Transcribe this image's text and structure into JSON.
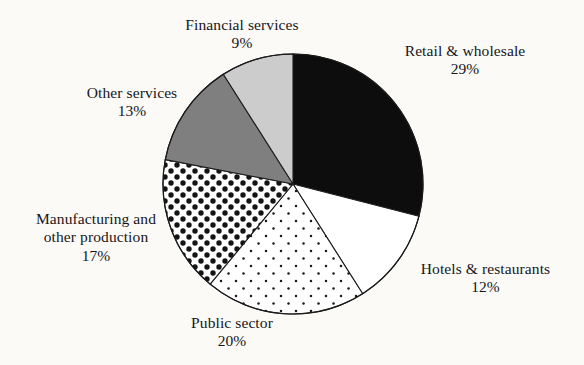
{
  "chart_data": {
    "type": "pie",
    "title": "",
    "subtitle": "",
    "xlabel": "",
    "ylabel": "",
    "legend_position": "none",
    "grid": false,
    "units": "percent",
    "start_angle_deg": 0,
    "direction": "clockwise",
    "categories": [
      "Retail & wholesale",
      "Hotels & restaurants",
      "Public sector",
      "Manufacturing and other production",
      "Other services",
      "Financial services"
    ],
    "values": [
      29,
      12,
      20,
      17,
      13,
      9
    ],
    "slices": [
      {
        "label": "Retail & wholesale",
        "label_line1": "Retail & wholesale",
        "label_line2": "",
        "value": 29,
        "percent_text": "29%",
        "fill": "solid-black",
        "color": "#0d0d0d",
        "start_deg": 0,
        "end_deg": 104.4
      },
      {
        "label": "Hotels & restaurants",
        "label_line1": "Hotels & restaurants",
        "label_line2": "",
        "value": 12,
        "percent_text": "12%",
        "fill": "solid-white",
        "color": "#ffffff",
        "start_deg": 104.4,
        "end_deg": 147.6
      },
      {
        "label": "Public sector",
        "label_line1": "Public sector",
        "label_line2": "",
        "value": 20,
        "percent_text": "20%",
        "fill": "fine-dots",
        "color": "#ffffff",
        "start_deg": 147.6,
        "end_deg": 219.6
      },
      {
        "label": "Manufacturing and other production",
        "label_line1": "Manufacturing and",
        "label_line2": "other production",
        "value": 17,
        "percent_text": "17%",
        "fill": "bold-polka-dots",
        "color": "#ffffff",
        "start_deg": 219.6,
        "end_deg": 280.8
      },
      {
        "label": "Other services",
        "label_line1": "Other services",
        "label_line2": "",
        "value": 13,
        "percent_text": "13%",
        "fill": "solid-mid-gray",
        "color": "#7f7f7f",
        "start_deg": 280.8,
        "end_deg": 327.6
      },
      {
        "label": "Financial services",
        "label_line1": "Financial services",
        "label_line2": "",
        "value": 9,
        "percent_text": "9%",
        "fill": "solid-light-gray",
        "color": "#cccccc",
        "start_deg": 327.6,
        "end_deg": 360
      }
    ]
  },
  "figure": {
    "background_color": "#fbfaf7",
    "outline_color": "#1a1a1a",
    "center_x": 293,
    "center_y": 184,
    "radius": 130
  }
}
